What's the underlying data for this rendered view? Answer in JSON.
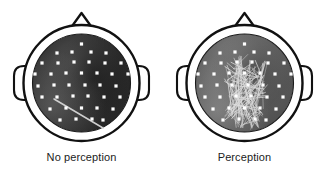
{
  "figure": {
    "background_color": "#ffffff",
    "width": 326,
    "height": 174
  },
  "panels": [
    {
      "id": "no-perception",
      "caption": "No perception",
      "scalp": {
        "fill_dark": "#2b2b2b",
        "fill_mid": "#3d3d3d",
        "fill_light": "#6f6f6f",
        "description": "dark grey scalp topography"
      },
      "outline_color": "#111111",
      "electrode_color": "#ffffff",
      "connection_color": "#cfcfcf",
      "electrode_count": 35,
      "connection_count": 1,
      "electrodes": [
        [
          81.5,
          44
        ],
        [
          57,
          53
        ],
        [
          72,
          52
        ],
        [
          91,
          52
        ],
        [
          106,
          53
        ],
        [
          42,
          63
        ],
        [
          58,
          63
        ],
        [
          74,
          62
        ],
        [
          89,
          62
        ],
        [
          105,
          63
        ],
        [
          121,
          63
        ],
        [
          35,
          74
        ],
        [
          51,
          74
        ],
        [
          66,
          73
        ],
        [
          81.5,
          73
        ],
        [
          97,
          73
        ],
        [
          112,
          74
        ],
        [
          128,
          74
        ],
        [
          38,
          86
        ],
        [
          54,
          85
        ],
        [
          69,
          85
        ],
        [
          85,
          85
        ],
        [
          100,
          85
        ],
        [
          116,
          86
        ],
        [
          42,
          97
        ],
        [
          57,
          97
        ],
        [
          73,
          96
        ],
        [
          88,
          96
        ],
        [
          104,
          97
        ],
        [
          120,
          97
        ],
        [
          50,
          109
        ],
        [
          66,
          108
        ],
        [
          81.5,
          108
        ],
        [
          97,
          108
        ],
        [
          113,
          109
        ],
        [
          60,
          120
        ],
        [
          76,
          119
        ],
        [
          92,
          119
        ],
        [
          103,
          120
        ]
      ],
      "connections": [
        [
          54,
          99,
          103,
          128
        ]
      ]
    },
    {
      "id": "perception",
      "caption": "Perception",
      "scalp": {
        "fill_dark": "#4a4a4a",
        "fill_mid": "#6b6b6b",
        "fill_light": "#909090",
        "description": "lighter grey scalp topography"
      },
      "outline_color": "#111111",
      "electrode_color": "#ffffff",
      "connection_color": "#dcdcdc",
      "electrode_count": 35,
      "connection_count": 120,
      "electrodes": [
        [
          81.5,
          44
        ],
        [
          57,
          53
        ],
        [
          72,
          52
        ],
        [
          91,
          52
        ],
        [
          106,
          53
        ],
        [
          42,
          63
        ],
        [
          58,
          63
        ],
        [
          74,
          62
        ],
        [
          89,
          62
        ],
        [
          105,
          63
        ],
        [
          121,
          63
        ],
        [
          35,
          74
        ],
        [
          51,
          74
        ],
        [
          66,
          73
        ],
        [
          81.5,
          73
        ],
        [
          97,
          73
        ],
        [
          112,
          74
        ],
        [
          128,
          74
        ],
        [
          38,
          86
        ],
        [
          54,
          85
        ],
        [
          69,
          85
        ],
        [
          85,
          85
        ],
        [
          100,
          85
        ],
        [
          116,
          86
        ],
        [
          42,
          97
        ],
        [
          57,
          97
        ],
        [
          73,
          96
        ],
        [
          88,
          96
        ],
        [
          104,
          97
        ],
        [
          120,
          97
        ],
        [
          50,
          109
        ],
        [
          66,
          108
        ],
        [
          81.5,
          108
        ],
        [
          97,
          108
        ],
        [
          113,
          109
        ],
        [
          60,
          120
        ],
        [
          76,
          119
        ],
        [
          92,
          119
        ],
        [
          103,
          120
        ]
      ],
      "hub_nodes": [
        [
          74,
          62
        ],
        [
          89,
          62
        ],
        [
          66,
          73
        ],
        [
          81.5,
          73
        ],
        [
          97,
          73
        ],
        [
          69,
          85
        ],
        [
          85,
          85
        ],
        [
          100,
          85
        ],
        [
          73,
          96
        ],
        [
          88,
          96
        ],
        [
          66,
          108
        ],
        [
          81.5,
          108
        ],
        [
          97,
          108
        ],
        [
          76,
          119
        ],
        [
          92,
          119
        ]
      ]
    }
  ]
}
